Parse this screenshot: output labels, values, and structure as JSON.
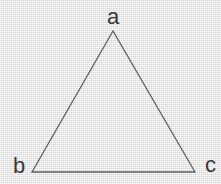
{
  "diagram": {
    "type": "triangle",
    "vertex_labels": {
      "top": "a",
      "bottom_left": "b",
      "bottom_right": "c"
    },
    "colors": {
      "background": "#e3e3e3",
      "line": "#5f5f5f",
      "label": "#383838"
    }
  }
}
